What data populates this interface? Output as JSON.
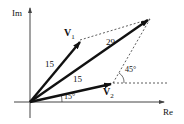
{
  "diagram": {
    "type": "phasor-diagram",
    "axes": {
      "imag_label": "Im",
      "real_label": "Re"
    },
    "vectors": [
      {
        "name": "V",
        "subscript": "1",
        "magnitude_label": "15",
        "angle_deg": 45
      },
      {
        "name": "V",
        "subscript": "2",
        "magnitude_label": "15",
        "angle_deg": 15
      },
      {
        "name": "resultant",
        "subscript": "",
        "magnitude_label": "29",
        "angle_deg": 30
      }
    ],
    "angle_labels": {
      "v2_angle": "15°",
      "between_angle": "45°"
    },
    "colors": {
      "line": "#111111",
      "dashed": "#333333",
      "axis": "#444444",
      "background": "#ffffff"
    }
  }
}
